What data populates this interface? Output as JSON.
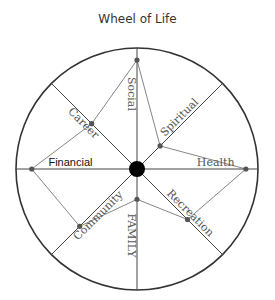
{
  "title": "Wheel of Life",
  "colors": {
    "rim": "#333333",
    "spoke": "#444444",
    "polygon": "#666666",
    "point": "#555555",
    "hub": "#000000",
    "label": "#555555",
    "label_emphasis": "#111111"
  },
  "chart_data": {
    "type": "radar",
    "title": "Wheel of Life",
    "scale": [
      0,
      1
    ],
    "categories": [
      {
        "name": "Social",
        "value": 0.9,
        "style": "serif"
      },
      {
        "name": "Spiritual",
        "value": 0.27,
        "style": "serif"
      },
      {
        "name": "Health",
        "value": 0.9,
        "style": "serif"
      },
      {
        "name": "Recreation",
        "value": 0.59,
        "style": "serif"
      },
      {
        "name": "FAMILY",
        "value": 0.25,
        "style": "serif"
      },
      {
        "name": "Community",
        "value": 0.67,
        "style": "serif"
      },
      {
        "name": "Financial",
        "value": 0.87,
        "style": "sans"
      },
      {
        "name": "Career",
        "value": 0.53,
        "style": "serif"
      }
    ]
  }
}
